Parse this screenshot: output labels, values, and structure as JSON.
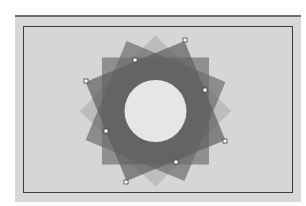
{
  "canvas": {
    "panel_color": "#d8d8d8",
    "artboard_color": "#d6d6d6",
    "artboard_border": "#3c3c3c"
  },
  "artwork": {
    "shape": "rotated-squares-rosette",
    "center": [
      155.5,
      111
    ],
    "square_side": 107,
    "rotations_deg": [
      45,
      0,
      22.5,
      -22.5
    ],
    "fill_colors": [
      "#b4b4b4",
      "#777777",
      "#6c6c6c",
      "#5e5e5e"
    ],
    "fill_opacity": [
      0.75,
      0.75,
      0.7,
      0.7
    ],
    "center_hole_radius": 31,
    "hole_color": "#e6e6e6"
  },
  "selection": {
    "selected_shape_rotation_deg": -22.5,
    "handles": [
      [
        185,
        40
      ],
      [
        135,
        60
      ],
      [
        86,
        81
      ],
      [
        205,
        90
      ],
      [
        106,
        131
      ],
      [
        225,
        141
      ],
      [
        176,
        162
      ],
      [
        126,
        182
      ]
    ]
  }
}
